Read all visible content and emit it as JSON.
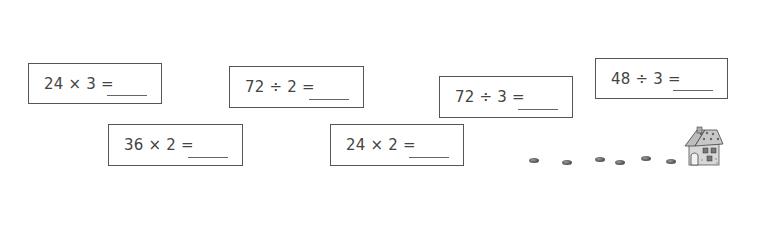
{
  "worksheet": {
    "problems": [
      {
        "id": "p1",
        "expression": "24 × 3 =",
        "answer": "",
        "box": {
          "x": 28,
          "y": 63,
          "w": 134,
          "h": 41
        }
      },
      {
        "id": "p2",
        "expression": "36 × 2 =",
        "answer": "",
        "box": {
          "x": 108,
          "y": 124,
          "w": 135,
          "h": 42
        }
      },
      {
        "id": "p3",
        "expression": "72 ÷ 2 =",
        "answer": "",
        "box": {
          "x": 229,
          "y": 66,
          "w": 135,
          "h": 42
        }
      },
      {
        "id": "p4",
        "expression": "24 × 2 =",
        "answer": "",
        "box": {
          "x": 330,
          "y": 124,
          "w": 134,
          "h": 42
        }
      },
      {
        "id": "p5",
        "expression": "72 ÷ 3 =",
        "answer": "",
        "box": {
          "x": 439,
          "y": 76,
          "w": 134,
          "h": 42
        }
      },
      {
        "id": "p6",
        "expression": "48 ÷ 3 =",
        "answer": "",
        "box": {
          "x": 595,
          "y": 58,
          "w": 133,
          "h": 41
        }
      }
    ],
    "decorations": {
      "stepping_stones": [
        {
          "x": 529,
          "y": 158
        },
        {
          "x": 562,
          "y": 160
        },
        {
          "x": 595,
          "y": 157
        },
        {
          "x": 615,
          "y": 160
        },
        {
          "x": 641,
          "y": 156
        },
        {
          "x": 666,
          "y": 159
        }
      ],
      "house_icon": "gingerbread-house-icon"
    },
    "colors": {
      "border": "#555555",
      "text": "#444444",
      "blank_line": "#666666",
      "background": "#ffffff"
    }
  }
}
